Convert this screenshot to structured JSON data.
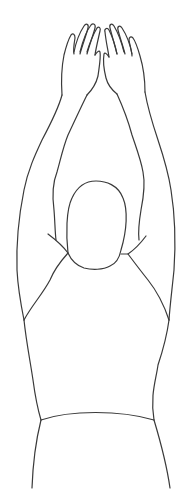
{
  "illustration": {
    "subject": "person with both arms raised overhead, hands together",
    "style": "line drawing",
    "stroke_color": "#3a3a3a",
    "background_color": "#ffffff",
    "parts": [
      "hands",
      "forearms",
      "upper-arms",
      "head",
      "shoulders",
      "torso",
      "waistline",
      "hips"
    ]
  }
}
